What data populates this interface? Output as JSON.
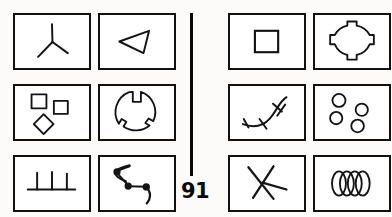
{
  "figure": {
    "page_number": "91",
    "layout": {
      "rows": 3,
      "columns_per_half": 2,
      "halves": 2,
      "total_cells": 12,
      "divider": "vertical-rule"
    },
    "stroke_color": "#111111",
    "background_color": "#ffffff",
    "cells": [
      {
        "id": "cell-1",
        "half": "left",
        "row": 1,
        "column": 1,
        "icon_name": "tripod-y-shape-icon",
        "description": "Three straight strokes radiating from a central point, forming a Y or tripod"
      },
      {
        "id": "cell-2",
        "half": "left",
        "row": 1,
        "column": 2,
        "icon_name": "left-pointing-triangle-icon",
        "description": "Small outlined triangle with apex pointing to the left"
      },
      {
        "id": "cell-3",
        "half": "left",
        "row": 2,
        "column": 1,
        "icon_name": "three-squares-icon",
        "description": "Three small outlined squares, the lower one rotated into a diamond"
      },
      {
        "id": "cell-4",
        "half": "left",
        "row": 2,
        "column": 2,
        "icon_name": "notched-circle-icon",
        "description": "Outlined circle with three rectangular notches cut inward from its rim"
      },
      {
        "id": "cell-5",
        "half": "left",
        "row": 3,
        "column": 1,
        "icon_name": "comb-three-prongs-icon",
        "description": "Horizontal baseline with three short vertical prongs rising from it"
      },
      {
        "id": "cell-6",
        "half": "left",
        "row": 3,
        "column": 2,
        "icon_name": "beaded-zigzag-path-icon",
        "description": "Zigzag path with three filled round beads and curled tails at both ends"
      },
      {
        "id": "cell-7",
        "half": "right",
        "row": 1,
        "column": 1,
        "icon_name": "square-in-square-icon",
        "description": "Small outlined square centered inside the cell frame"
      },
      {
        "id": "cell-8",
        "half": "right",
        "row": 1,
        "column": 2,
        "icon_name": "tabbed-circle-icon",
        "description": "Outlined circle with four rectangular tabs protruding at top, bottom, left and right"
      },
      {
        "id": "cell-9",
        "half": "right",
        "row": 2,
        "column": 1,
        "icon_name": "hatched-curve-icon",
        "description": "Rising curved line crossed by three short hatch marks"
      },
      {
        "id": "cell-10",
        "half": "right",
        "row": 2,
        "column": 2,
        "icon_name": "four-circles-icon",
        "description": "Four small outlined circles scattered across the cell"
      },
      {
        "id": "cell-11",
        "half": "right",
        "row": 3,
        "column": 1,
        "icon_name": "crossed-strokes-x-icon",
        "description": "Two long strokes crossing to form an asymmetric X"
      },
      {
        "id": "cell-12",
        "half": "right",
        "row": 3,
        "column": 2,
        "icon_name": "overlapping-ellipses-icon",
        "description": "Four narrow vertical lens shapes overlapping in a horizontal row"
      }
    ]
  }
}
